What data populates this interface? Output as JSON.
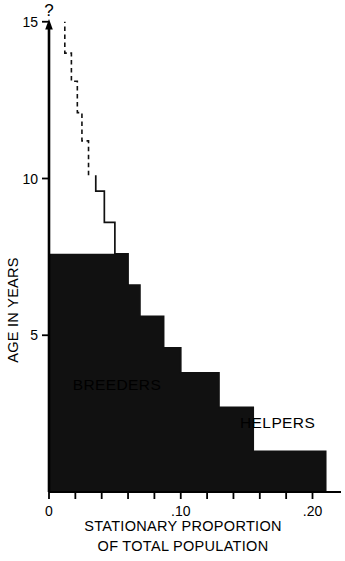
{
  "chart_data": {
    "type": "area",
    "title": "",
    "xlabel": "STATIONARY PROPORTION OF TOTAL POPULATION",
    "xlabel_line1": "STATIONARY PROPORTION",
    "xlabel_line2": "OF TOTAL POPULATION",
    "ylabel": "AGE IN YEARS",
    "xlim": [
      0,
      0.215
    ],
    "ylim": [
      0,
      15
    ],
    "grid": false,
    "legend_position": "inline-annotations",
    "x_ticks": [
      0,
      0.02,
      0.04,
      0.06,
      0.08,
      0.1,
      0.12,
      0.14,
      0.16,
      0.18,
      0.2
    ],
    "x_tick_labels": [
      {
        "value": 0,
        "label": "0"
      },
      {
        "value": 0.1,
        "label": ".10"
      },
      {
        "value": 0.2,
        "label": ".20"
      }
    ],
    "y_ticks": [
      5,
      10,
      15
    ],
    "y_tick_labels": [
      {
        "value": 5,
        "label": "5"
      },
      {
        "value": 10,
        "label": "10"
      },
      {
        "value": 15,
        "label": "15"
      }
    ],
    "axis_top_annotation": "?",
    "series": [
      {
        "name": "BREEDERS",
        "style": "outline",
        "note": "total population outline; solid below age 10, dashed above age 10",
        "steps": [
          {
            "age_low": 0,
            "age_high": 1.3,
            "proportion": 0.21
          },
          {
            "age_low": 1.3,
            "age_high": 2.7,
            "proportion": 0.155
          },
          {
            "age_low": 2.7,
            "age_high": 3.8,
            "proportion": 0.129
          },
          {
            "age_low": 3.8,
            "age_high": 4.6,
            "proportion": 0.1
          },
          {
            "age_low": 4.6,
            "age_high": 5.6,
            "proportion": 0.087
          },
          {
            "age_low": 5.6,
            "age_high": 6.6,
            "proportion": 0.069
          },
          {
            "age_low": 6.6,
            "age_high": 7.6,
            "proportion": 0.06
          },
          {
            "age_low": 7.6,
            "age_high": 8.6,
            "proportion": 0.05
          },
          {
            "age_low": 8.6,
            "age_high": 9.6,
            "proportion": 0.042
          },
          {
            "age_low": 9.6,
            "age_high": 10.1,
            "proportion": 0.0355
          },
          {
            "age_low": 10.1,
            "age_high": 11.2,
            "proportion": 0.03
          },
          {
            "age_low": 11.2,
            "age_high": 12.1,
            "proportion": 0.025
          },
          {
            "age_low": 12.1,
            "age_high": 13.1,
            "proportion": 0.0215
          },
          {
            "age_low": 13.1,
            "age_high": 14.0,
            "proportion": 0.017
          },
          {
            "age_low": 14.0,
            "age_high": 15.0,
            "proportion": 0.012
          }
        ]
      },
      {
        "name": "HELPERS",
        "style": "filled",
        "fill_color": "#111111",
        "note": "non-breeding helpers, filled black, nested within total outline",
        "steps": [
          {
            "age_low": 0,
            "age_high": 1.3,
            "proportion": 0.21
          },
          {
            "age_low": 1.3,
            "age_high": 2.7,
            "proportion": 0.155
          },
          {
            "age_low": 2.7,
            "age_high": 3.8,
            "proportion": 0.129
          },
          {
            "age_low": 3.8,
            "age_high": 4.6,
            "proportion": 0.1
          },
          {
            "age_low": 4.6,
            "age_high": 5.6,
            "proportion": 0.087
          },
          {
            "age_low": 5.6,
            "age_high": 6.6,
            "proportion": 0.069
          },
          {
            "age_low": 6.6,
            "age_high": 7.6,
            "proportion": 0.06
          }
        ]
      }
    ],
    "annotations": [
      {
        "text": "BREEDERS",
        "x": 0.018,
        "y": 3.25
      },
      {
        "text": "HELPERS",
        "x": 0.145,
        "y": 2.05
      }
    ],
    "colors": {
      "axis": "#000000",
      "outline": "#111111",
      "fill": "#111111",
      "background": "#ffffff"
    }
  }
}
